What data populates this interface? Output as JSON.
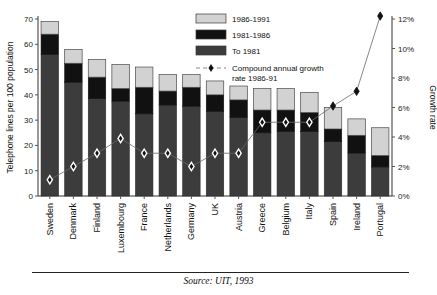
{
  "source_note": "Source: UIT, 1993",
  "legend": {
    "items": [
      {
        "label": "1986-1991",
        "swatch": "#d2d2d2",
        "type": "swatch"
      },
      {
        "label": "1981-1986",
        "swatch": "#111111",
        "type": "swatch"
      },
      {
        "label": "To 1981",
        "swatch": "#3c3c3c",
        "type": "swatch"
      },
      {
        "label": "Compound annual growth",
        "label2": "rate 1986-91",
        "swatch": "#111111",
        "type": "marker"
      }
    ]
  },
  "chart_data": {
    "type": "bar",
    "title": "",
    "subtitle": "",
    "xlabel": "",
    "ylabel": "Telephone lines per 100 population",
    "y2label": "Growth rate",
    "ylim": [
      0,
      70
    ],
    "y2lim": [
      0,
      12
    ],
    "yticks": [
      "0",
      "10",
      "20",
      "30",
      "40",
      "50",
      "60",
      "70"
    ],
    "y2ticks": [
      "0%",
      "2%",
      "4%",
      "6%",
      "8%",
      "10%",
      "12%"
    ],
    "grid": false,
    "legend_position": "top-center",
    "categories": [
      "Sweden",
      "Denmark",
      "Finland",
      "Luxembourg",
      "France",
      "Netherlands",
      "Germany",
      "UK",
      "Austria",
      "Greece",
      "Belgium",
      "Italy",
      "Spain",
      "Ireland",
      "Portugal"
    ],
    "series": [
      {
        "name": "To 1981",
        "color": "#3c3c3c",
        "values": [
          56.0,
          45.0,
          38.5,
          37.5,
          32.5,
          36.0,
          35.5,
          33.5,
          31.0,
          25.0,
          25.5,
          25.5,
          21.5,
          17.0,
          11.5
        ]
      },
      {
        "name": "1981-1986",
        "color": "#111111",
        "values": [
          8.0,
          7.5,
          8.5,
          5.0,
          10.5,
          5.5,
          7.5,
          6.5,
          7.0,
          9.0,
          8.5,
          7.5,
          5.0,
          7.0,
          4.5
        ]
      },
      {
        "name": "1986-1991",
        "color": "#d2d2d2",
        "values": [
          5.0,
          5.5,
          7.0,
          9.5,
          8.0,
          6.5,
          5.0,
          5.5,
          5.5,
          8.5,
          8.5,
          8.0,
          8.5,
          6.5,
          11.0
        ]
      }
    ],
    "totals": [
      69.0,
      58.0,
      54.0,
      52.0,
      51.0,
      48.0,
      48.0,
      45.5,
      43.5,
      42.5,
      42.5,
      41.0,
      35.0,
      30.5,
      27.0
    ],
    "growth_series": {
      "name": "Compound annual growth rate 1986-91",
      "marker": "diamond",
      "unit": "%",
      "color": "#6a6a6a",
      "values": [
        1.1,
        2.0,
        2.9,
        3.9,
        2.9,
        2.9,
        2.0,
        2.9,
        2.9,
        5.0,
        5.0,
        5.0,
        6.1,
        7.1,
        12.2
      ]
    }
  }
}
